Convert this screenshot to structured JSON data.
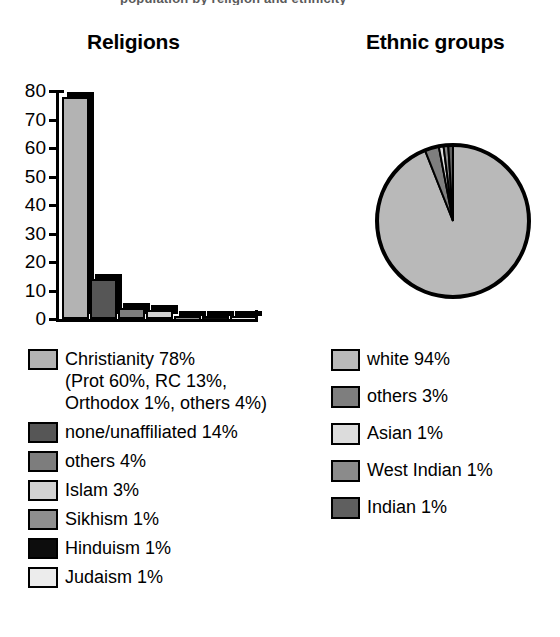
{
  "top_cropped_line": "population by religion and ethnicity",
  "charts": {
    "religions": {
      "title": "Religions",
      "legend": [
        {
          "label": "Christianity 78%\n(Prot 60%, RC 13%,\nOrthodox 1%, others 4%)",
          "color": "#b3b3b3",
          "name": "christianity"
        },
        {
          "label": "none/unaffiliated 14%",
          "color": "#565656",
          "name": "none-unaffiliated"
        },
        {
          "label": "others 4%",
          "color": "#7d7d7d",
          "name": "others"
        },
        {
          "label": "Islam 3%",
          "color": "#d2d2d2",
          "name": "islam"
        },
        {
          "label": "Sikhism 1%",
          "color": "#8e8e8e",
          "name": "sikhism"
        },
        {
          "label": "Hinduism 1%",
          "color": "#0d0d0d",
          "name": "hinduism"
        },
        {
          "label": "Judaism 1%",
          "color": "#ececec",
          "name": "judaism"
        }
      ]
    },
    "ethnic": {
      "title": "Ethnic groups",
      "legend": [
        {
          "label": "white 94%",
          "color": "#b9b9b9",
          "name": "white"
        },
        {
          "label": "others 3%",
          "color": "#7e7e7e",
          "name": "others"
        },
        {
          "label": "Asian 1%",
          "color": "#dcdcdc",
          "name": "asian"
        },
        {
          "label": "West Indian 1%",
          "color": "#8b8b8b",
          "name": "west-indian"
        },
        {
          "label": "Indian 1%",
          "color": "#5f5f5f",
          "name": "indian"
        }
      ]
    }
  },
  "chart_data": [
    {
      "type": "bar",
      "title": "Religions",
      "xlabel": "",
      "ylabel": "",
      "ylim": [
        0,
        80
      ],
      "yticks": [
        0,
        10,
        20,
        30,
        40,
        50,
        60,
        70,
        80
      ],
      "grid": false,
      "legend_position": "below",
      "categories": [
        "Christianity",
        "none/unaffiliated",
        "others",
        "Islam",
        "Sikhism",
        "Hinduism",
        "Judaism"
      ],
      "values": [
        78,
        14,
        4,
        3,
        1,
        1,
        1
      ],
      "colors": [
        "#b3b3b3",
        "#565656",
        "#7d7d7d",
        "#d2d2d2",
        "#8e8e8e",
        "#0d0d0d",
        "#ececec"
      ],
      "annotations": [
        "Christianity breakdown: Prot 60%, RC 13%, Orthodox 1%, others 4%"
      ]
    },
    {
      "type": "pie",
      "title": "Ethnic groups",
      "legend_position": "below",
      "labels": [
        "white",
        "others",
        "Asian",
        "West Indian",
        "Indian"
      ],
      "values": [
        94,
        3,
        1,
        1,
        1
      ],
      "colors": [
        "#b9b9b9",
        "#7e7e7e",
        "#dcdcdc",
        "#8b8b8b",
        "#5f5f5f"
      ],
      "start_angle_deg": 0,
      "direction": "clockwise"
    }
  ]
}
